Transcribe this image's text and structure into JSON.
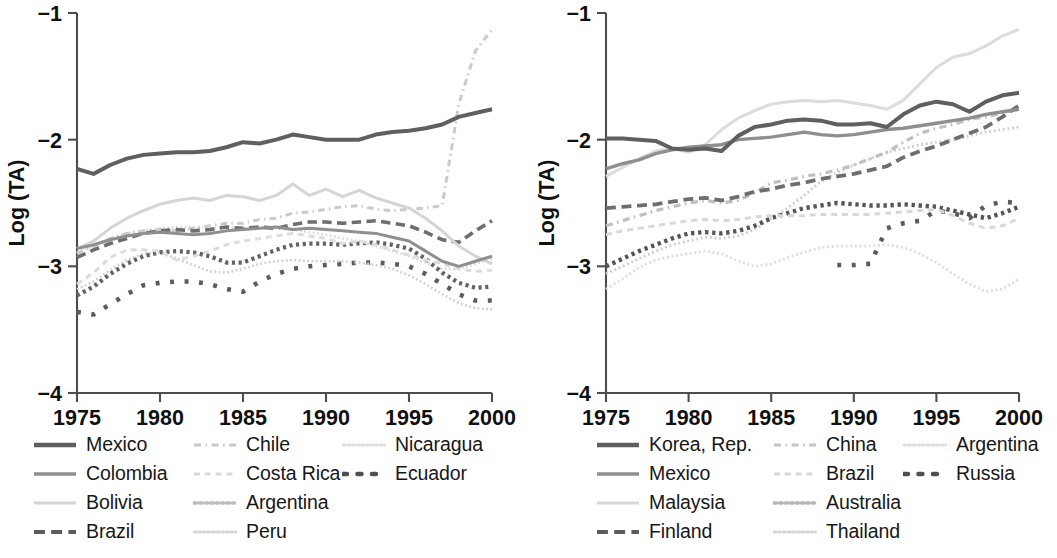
{
  "figure": {
    "background_color": "#ffffff",
    "panels": [
      "left",
      "right"
    ]
  },
  "chart_data": [
    {
      "id": "left",
      "type": "line",
      "title": "",
      "xlabel": "",
      "ylabel": "Log (TA)",
      "xlim": [
        1975,
        2000
      ],
      "ylim": [
        -4,
        -1
      ],
      "xticks": [
        1975,
        1980,
        1985,
        1990,
        1995,
        2000
      ],
      "xticklabels": [
        "1975",
        "1980",
        "1985",
        "1990",
        "1995",
        "2000"
      ],
      "yticks": [
        -1,
        -2,
        -3,
        -4
      ],
      "yticklabels": [
        "−1",
        "−2",
        "−3",
        "−4"
      ],
      "grid": false,
      "legend_position": "below",
      "legend_columns": 3,
      "x": [
        1975,
        1976,
        1977,
        1978,
        1979,
        1980,
        1981,
        1982,
        1983,
        1984,
        1985,
        1986,
        1987,
        1988,
        1989,
        1990,
        1991,
        1992,
        1993,
        1994,
        1995,
        1996,
        1997,
        1998,
        1999,
        2000
      ],
      "series": [
        {
          "name": "Mexico",
          "style": "solid",
          "color": "#5f5f5f",
          "width": 4.0,
          "values": [
            -2.23,
            -2.27,
            -2.2,
            -2.15,
            -2.12,
            -2.11,
            -2.1,
            -2.1,
            -2.09,
            -2.06,
            -2.02,
            -2.03,
            -2.0,
            -1.96,
            -1.98,
            -2.0,
            -2.0,
            -2.0,
            -1.96,
            -1.94,
            -1.93,
            -1.91,
            -1.88,
            -1.82,
            -1.79,
            -1.76
          ]
        },
        {
          "name": "Colombia",
          "style": "solid",
          "color": "#8f8f8f",
          "width": 3.0,
          "values": [
            -2.86,
            -2.83,
            -2.79,
            -2.76,
            -2.74,
            -2.73,
            -2.74,
            -2.75,
            -2.74,
            -2.72,
            -2.71,
            -2.7,
            -2.69,
            -2.71,
            -2.7,
            -2.71,
            -2.72,
            -2.73,
            -2.74,
            -2.77,
            -2.8,
            -2.88,
            -2.96,
            -3.0,
            -2.96,
            -2.92
          ]
        },
        {
          "name": "Bolivia",
          "style": "solid",
          "color": "#d5d5d5",
          "width": 3.0,
          "values": [
            -2.86,
            -2.8,
            -2.7,
            -2.62,
            -2.56,
            -2.51,
            -2.48,
            -2.46,
            -2.48,
            -2.44,
            -2.45,
            -2.48,
            -2.44,
            -2.35,
            -2.44,
            -2.39,
            -2.45,
            -2.4,
            -2.46,
            -2.5,
            -2.54,
            -2.62,
            -2.72,
            -2.84,
            -2.92,
            -2.98
          ]
        },
        {
          "name": "Brazil",
          "style": "dash-long",
          "color": "#6e6e6e",
          "width": 3.6,
          "values": [
            -2.93,
            -2.87,
            -2.82,
            -2.78,
            -2.74,
            -2.72,
            -2.71,
            -2.72,
            -2.71,
            -2.69,
            -2.7,
            -2.69,
            -2.7,
            -2.67,
            -2.65,
            -2.65,
            -2.66,
            -2.65,
            -2.64,
            -2.66,
            -2.68,
            -2.73,
            -2.79,
            -2.81,
            -2.72,
            -2.64
          ]
        },
        {
          "name": "Chile",
          "style": "dash-dot",
          "color": "#cacaca",
          "width": 3.0,
          "values": [
            -2.9,
            -2.84,
            -2.78,
            -2.74,
            -2.72,
            -2.71,
            -2.72,
            -2.7,
            -2.68,
            -2.66,
            -2.66,
            -2.63,
            -2.62,
            -2.58,
            -2.57,
            -2.55,
            -2.53,
            -2.52,
            -2.55,
            -2.56,
            -2.55,
            -2.54,
            -2.52,
            -1.72,
            -1.3,
            -1.13
          ]
        },
        {
          "name": "Costa Rica",
          "style": "dash-short",
          "color": "#dcdcdc",
          "width": 3.0,
          "values": [
            -3.14,
            -3.05,
            -2.93,
            -2.87,
            -2.87,
            -2.88,
            -2.95,
            -2.92,
            -2.88,
            -2.83,
            -2.8,
            -2.78,
            -2.76,
            -2.74,
            -2.76,
            -2.78,
            -2.82,
            -2.8,
            -2.83,
            -2.87,
            -2.91,
            -2.95,
            -2.98,
            -3.02,
            -3.04,
            -3.03
          ]
        },
        {
          "name": "Argentina",
          "style": "dot-heavy",
          "color": "#636363",
          "width": 4.2,
          "values": [
            -3.23,
            -3.16,
            -3.06,
            -2.98,
            -2.92,
            -2.89,
            -2.88,
            -2.89,
            -2.92,
            -2.97,
            -2.97,
            -2.92,
            -2.87,
            -2.83,
            -2.82,
            -2.82,
            -2.83,
            -2.82,
            -2.81,
            -2.83,
            -2.86,
            -2.94,
            -3.05,
            -3.13,
            -3.17,
            -3.16
          ]
        },
        {
          "name": "Peru",
          "style": "dot-fine",
          "color": "#d0d0d0",
          "width": 2.6,
          "values": [
            -3.18,
            -3.12,
            -3.03,
            -2.95,
            -2.9,
            -2.89,
            -2.94,
            -2.99,
            -3.04,
            -3.05,
            -3.02,
            -2.98,
            -2.96,
            -2.95,
            -2.96,
            -2.96,
            -2.96,
            -2.97,
            -2.99,
            -3.02,
            -3.07,
            -3.14,
            -3.22,
            -3.29,
            -3.33,
            -3.34
          ]
        },
        {
          "name": "Nicaragua",
          "style": "dot-fine",
          "color": "#dadada",
          "width": 2.6,
          "values": [
            -2.89,
            -2.84,
            -2.78,
            -2.74,
            -2.72,
            -2.7,
            -2.69,
            -2.69,
            -2.7,
            -2.69,
            -2.7,
            -2.69,
            -2.7,
            -2.71,
            -2.73,
            -2.75,
            -2.78,
            -2.8,
            -2.84,
            -2.88,
            -2.92,
            -2.97,
            -3.02,
            -3.02,
            -2.98,
            -2.94
          ]
        },
        {
          "name": "Ecuador",
          "style": "dot-sparse",
          "color": "#5c5c5c",
          "width": 4.6,
          "values": [
            -3.36,
            -3.38,
            -3.3,
            -3.22,
            -3.15,
            -3.13,
            -3.12,
            -3.12,
            -3.14,
            -3.18,
            -3.2,
            -3.12,
            -3.06,
            -3.02,
            -3.0,
            -2.99,
            -2.98,
            -2.97,
            -2.97,
            -2.98,
            -3.0,
            -3.06,
            -3.14,
            -3.22,
            -3.27,
            -3.27
          ]
        }
      ]
    },
    {
      "id": "right",
      "type": "line",
      "title": "",
      "xlabel": "",
      "ylabel": "Log (TA)",
      "xlim": [
        1975,
        2000
      ],
      "ylim": [
        -4,
        -1
      ],
      "xticks": [
        1975,
        1980,
        1985,
        1990,
        1995,
        2000
      ],
      "xticklabels": [
        "1975",
        "1980",
        "1985",
        "1990",
        "1995",
        "2000"
      ],
      "yticks": [
        -1,
        -2,
        -3,
        -4
      ],
      "yticklabels": [
        "−1",
        "−2",
        "−3",
        "−4"
      ],
      "grid": false,
      "legend_position": "below",
      "legend_columns": 3,
      "x": [
        1975,
        1976,
        1977,
        1978,
        1979,
        1980,
        1981,
        1982,
        1983,
        1984,
        1985,
        1986,
        1987,
        1988,
        1989,
        1990,
        1991,
        1992,
        1993,
        1994,
        1995,
        1996,
        1997,
        1998,
        1999,
        2000
      ],
      "series": [
        {
          "name": "Korea, Rep.",
          "style": "solid",
          "color": "#5f5f5f",
          "width": 4.0,
          "values": [
            -1.99,
            -1.99,
            -2.0,
            -2.01,
            -2.07,
            -2.08,
            -2.07,
            -2.09,
            -1.97,
            -1.9,
            -1.88,
            -1.85,
            -1.84,
            -1.85,
            -1.88,
            -1.88,
            -1.87,
            -1.9,
            -1.8,
            -1.73,
            -1.7,
            -1.72,
            -1.78,
            -1.7,
            -1.65,
            -1.63
          ]
        },
        {
          "name": "Mexico",
          "style": "solid",
          "color": "#8f8f8f",
          "width": 3.4,
          "values": [
            -2.23,
            -2.19,
            -2.16,
            -2.11,
            -2.08,
            -2.06,
            -2.05,
            -2.04,
            -2.0,
            -1.99,
            -1.98,
            -1.96,
            -1.94,
            -1.96,
            -1.97,
            -1.96,
            -1.94,
            -1.92,
            -1.91,
            -1.89,
            -1.87,
            -1.85,
            -1.83,
            -1.8,
            -1.78,
            -1.76
          ]
        },
        {
          "name": "Malaysia",
          "style": "solid",
          "color": "#dcdcdc",
          "width": 3.0,
          "values": [
            -2.29,
            -2.22,
            -2.15,
            -2.09,
            -2.07,
            -2.1,
            -2.04,
            -1.92,
            -1.83,
            -1.77,
            -1.72,
            -1.7,
            -1.69,
            -1.7,
            -1.69,
            -1.71,
            -1.73,
            -1.76,
            -1.69,
            -1.56,
            -1.43,
            -1.35,
            -1.32,
            -1.26,
            -1.18,
            -1.13
          ]
        },
        {
          "name": "Finland",
          "style": "dash-long",
          "color": "#6e6e6e",
          "width": 3.8,
          "values": [
            -2.54,
            -2.53,
            -2.52,
            -2.51,
            -2.49,
            -2.47,
            -2.46,
            -2.48,
            -2.45,
            -2.41,
            -2.39,
            -2.36,
            -2.34,
            -2.31,
            -2.29,
            -2.27,
            -2.24,
            -2.21,
            -2.14,
            -2.09,
            -2.05,
            -2.0,
            -1.95,
            -1.9,
            -1.82,
            -1.73
          ]
        },
        {
          "name": "China",
          "style": "dash-dot",
          "color": "#bfbfbf",
          "width": 3.2,
          "values": [
            -2.68,
            -2.64,
            -2.6,
            -2.56,
            -2.53,
            -2.5,
            -2.48,
            -2.5,
            -2.48,
            -2.42,
            -2.34,
            -2.32,
            -2.29,
            -2.27,
            -2.24,
            -2.2,
            -2.15,
            -2.1,
            -2.02,
            -1.95,
            -1.91,
            -1.88,
            -1.84,
            -1.82,
            -1.79,
            -1.75
          ]
        },
        {
          "name": "Brazil",
          "style": "dash-short",
          "color": "#d8d8d8",
          "width": 3.0,
          "values": [
            -2.75,
            -2.72,
            -2.7,
            -2.68,
            -2.66,
            -2.64,
            -2.63,
            -2.64,
            -2.63,
            -2.61,
            -2.6,
            -2.6,
            -2.6,
            -2.59,
            -2.59,
            -2.59,
            -2.59,
            -2.58,
            -2.57,
            -2.56,
            -2.55,
            -2.6,
            -2.66,
            -2.7,
            -2.68,
            -2.62
          ]
        },
        {
          "name": "Australia",
          "style": "dot-heavy",
          "color": "#555555",
          "width": 4.4,
          "values": [
            -3.0,
            -2.94,
            -2.88,
            -2.83,
            -2.78,
            -2.74,
            -2.73,
            -2.74,
            -2.72,
            -2.68,
            -2.62,
            -2.58,
            -2.54,
            -2.52,
            -2.5,
            -2.51,
            -2.52,
            -2.52,
            -2.51,
            -2.52,
            -2.53,
            -2.56,
            -2.59,
            -2.62,
            -2.58,
            -2.53
          ]
        },
        {
          "name": "Thailand",
          "style": "dot-fine",
          "color": "#cfcfcf",
          "width": 2.8,
          "values": [
            -3.06,
            -3.0,
            -2.94,
            -2.88,
            -2.83,
            -2.8,
            -2.77,
            -2.78,
            -2.76,
            -2.71,
            -2.62,
            -2.54,
            -2.44,
            -2.33,
            -2.26,
            -2.2,
            -2.15,
            -2.1,
            -2.07,
            -2.04,
            -2.02,
            -2.0,
            -1.97,
            -1.94,
            -1.92,
            -1.9
          ]
        },
        {
          "name": "Argentina",
          "style": "dot-fine",
          "color": "#dddddd",
          "width": 2.8,
          "values": [
            -3.18,
            -3.1,
            -3.01,
            -2.95,
            -2.92,
            -2.9,
            -2.88,
            -2.9,
            -2.96,
            -3.0,
            -2.98,
            -2.93,
            -2.89,
            -2.85,
            -2.84,
            -2.84,
            -2.84,
            -2.83,
            -2.85,
            -2.9,
            -2.97,
            -3.06,
            -3.14,
            -3.2,
            -3.18,
            -3.1
          ]
        },
        {
          "name": "Russia",
          "style": "dot-sparse",
          "color": "#5c5c5c",
          "width": 4.6,
          "values": [
            null,
            null,
            null,
            null,
            null,
            null,
            null,
            null,
            null,
            null,
            null,
            null,
            null,
            null,
            -2.99,
            -2.99,
            -2.98,
            -2.7,
            -2.66,
            -2.64,
            -2.56,
            -2.58,
            -2.62,
            -2.52,
            -2.49,
            -2.5
          ]
        }
      ]
    }
  ],
  "panels": {
    "left": {
      "axis": {
        "ylabel": "Log (TA)",
        "xticklabels": [
          "1975",
          "1980",
          "1985",
          "1990",
          "1995",
          "2000"
        ],
        "yticklabels": [
          "−1",
          "−2",
          "−3",
          "−4"
        ]
      },
      "legend": [
        {
          "label": "Mexico",
          "style": "solid",
          "color": "#5f5f5f",
          "width": 4.4
        },
        {
          "label": "Colombia",
          "style": "solid",
          "color": "#8f8f8f",
          "width": 3.6
        },
        {
          "label": "Bolivia",
          "style": "solid",
          "color": "#d5d5d5",
          "width": 3.2
        },
        {
          "label": "Brazil",
          "style": "dash-long",
          "color": "#5c5c5c",
          "width": 4.2
        },
        {
          "label": "Chile",
          "style": "dash-dot",
          "color": "#c8c8c8",
          "width": 3.2
        },
        {
          "label": "Costa Rica",
          "style": "dash-short",
          "color": "#dadada",
          "width": 3.0
        },
        {
          "label": "Argentina",
          "style": "dot-heavy",
          "color": "#bdbdbd",
          "width": 3.4
        },
        {
          "label": "Peru",
          "style": "dot-fine",
          "color": "#d6d6d6",
          "width": 2.8
        },
        {
          "label": "Nicaragua",
          "style": "dot-fine",
          "color": "#dedede",
          "width": 2.8
        },
        {
          "label": "Ecuador",
          "style": "dot-sparse",
          "color": "#4f4f4f",
          "width": 4.6
        }
      ]
    },
    "right": {
      "axis": {
        "ylabel": "Log (TA)",
        "xticklabels": [
          "1975",
          "1980",
          "1985",
          "1990",
          "1995",
          "2000"
        ],
        "yticklabels": [
          "−1",
          "−2",
          "−3",
          "−4"
        ]
      },
      "legend": [
        {
          "label": "Korea, Rep.",
          "style": "solid",
          "color": "#5f5f5f",
          "width": 4.4
        },
        {
          "label": "Mexico",
          "style": "solid",
          "color": "#8f8f8f",
          "width": 3.6
        },
        {
          "label": "Malaysia",
          "style": "solid",
          "color": "#d8d8d8",
          "width": 3.2
        },
        {
          "label": "Finland",
          "style": "dash-long",
          "color": "#5c5c5c",
          "width": 4.2
        },
        {
          "label": "China",
          "style": "dash-dot",
          "color": "#c4c4c4",
          "width": 3.2
        },
        {
          "label": "Brazil",
          "style": "dash-short",
          "color": "#d8d8d8",
          "width": 3.0
        },
        {
          "label": "Australia",
          "style": "dot-heavy",
          "color": "#b5b5b5",
          "width": 3.4
        },
        {
          "label": "Thailand",
          "style": "dot-fine",
          "color": "#d6d6d6",
          "width": 2.8
        },
        {
          "label": "Argentina",
          "style": "dot-fine",
          "color": "#dedede",
          "width": 2.8
        },
        {
          "label": "Russia",
          "style": "dot-sparse",
          "color": "#4f4f4f",
          "width": 4.6
        }
      ]
    }
  }
}
